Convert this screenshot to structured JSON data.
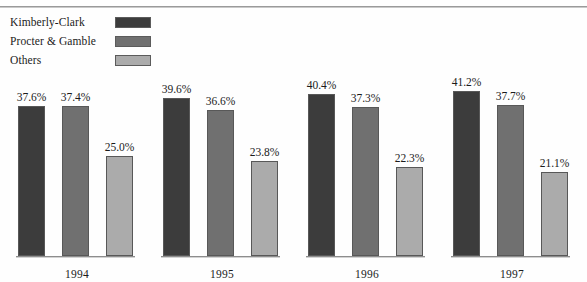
{
  "legend": {
    "items": [
      {
        "label": "Kimberly-Clark",
        "color": "#3c3c3c"
      },
      {
        "label": "Procter & Gamble",
        "color": "#707070"
      },
      {
        "label": "Others",
        "color": "#ababab"
      }
    ]
  },
  "chart_data": {
    "type": "bar",
    "title": "",
    "xlabel": "",
    "ylabel": "",
    "grid": false,
    "legend_position": "top-left",
    "ylim": [
      0,
      45
    ],
    "value_suffix": "%",
    "categories": [
      "1994",
      "1995",
      "1996",
      "1997"
    ],
    "series": [
      {
        "name": "Kimberly-Clark",
        "color": "#3c3c3c",
        "values": [
          37.6,
          39.6,
          40.4,
          41.2
        ],
        "labels": [
          "37.6%",
          "39.6%",
          "40.4%",
          "41.2%"
        ]
      },
      {
        "name": "Procter & Gamble",
        "color": "#707070",
        "values": [
          37.4,
          36.6,
          37.3,
          37.7
        ],
        "labels": [
          "37.4%",
          "36.6%",
          "37.3%",
          "37.7%"
        ]
      },
      {
        "name": "Others",
        "color": "#ababab",
        "values": [
          25.0,
          23.8,
          22.3,
          21.1
        ],
        "labels": [
          "25.0%",
          "23.8%",
          "22.3%",
          "21.1%"
        ]
      }
    ]
  }
}
